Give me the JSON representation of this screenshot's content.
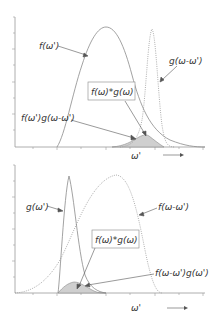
{
  "panels": [
    {
      "id": "top",
      "labels": {
        "f_curve": "f(ω')",
        "g_curve": "g(ω-ω')",
        "convolution_box": "f(ω)*g(ω)",
        "product": "f(ω')g(ω-ω')",
        "x_axis": "ω'"
      }
    },
    {
      "id": "bottom",
      "labels": {
        "g_curve": "g(ω')",
        "f_curve": "f(ω-ω')",
        "convolution_box": "f(ω)*g(ω)",
        "product": "f(ω-ω')g(ω')",
        "x_axis": "ω'"
      }
    }
  ],
  "colors": {
    "curve": "#8a8a8a",
    "text": "#333333",
    "shade": "#cfcfcf",
    "axis": "#9a9a9a"
  }
}
